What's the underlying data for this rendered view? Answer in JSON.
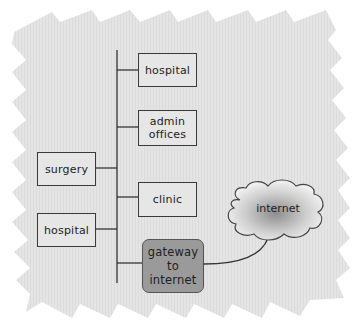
{
  "diagram": {
    "type": "network-topology",
    "spine": "backbone",
    "right_nodes": [
      {
        "id": "hospital-right",
        "label": "hospital"
      },
      {
        "id": "admin-offices",
        "label": "admin\noffices"
      },
      {
        "id": "clinic",
        "label": "clinic"
      },
      {
        "id": "gateway",
        "label": "gateway\nto\ninternet"
      }
    ],
    "left_nodes": [
      {
        "id": "surgery",
        "label": "surgery"
      },
      {
        "id": "hospital-left",
        "label": "hospital"
      }
    ],
    "cloud": {
      "id": "internet",
      "label": "internet"
    },
    "edges": [
      [
        "backbone",
        "hospital-right"
      ],
      [
        "backbone",
        "admin-offices"
      ],
      [
        "backbone",
        "clinic"
      ],
      [
        "backbone",
        "gateway"
      ],
      [
        "backbone",
        "surgery"
      ],
      [
        "backbone",
        "hospital-left"
      ],
      [
        "gateway",
        "internet"
      ]
    ],
    "colors": {
      "background": "#e6e6e6",
      "box_fill": "#e6e6e6",
      "gateway_fill": "#9a9a9a",
      "line": "#333333"
    }
  }
}
